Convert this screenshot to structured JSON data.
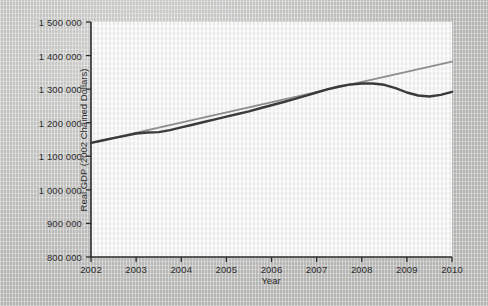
{
  "chart_data": {
    "type": "line",
    "title": "",
    "xlabel": "Year",
    "ylabel": "Real GDP (2002 Chained Dollars)",
    "xlim": [
      2002,
      2010
    ],
    "ylim": [
      800000,
      1500000
    ],
    "grid": false,
    "legend": "none",
    "xticklabels": [
      "2002",
      "2003",
      "2004",
      "2005",
      "2006",
      "2007",
      "2008",
      "2009",
      "2010"
    ],
    "xtickvalues": [
      2002,
      2003,
      2004,
      2005,
      2006,
      2007,
      2008,
      2009,
      2010
    ],
    "yticklabels": [
      "800 000",
      "900 000",
      "1 000 000",
      "1 100 000",
      "1 200 000",
      "1 300 000",
      "1 400 000",
      "1 500 000"
    ],
    "ytickvalues": [
      800000,
      900000,
      1000000,
      1100000,
      1200000,
      1300000,
      1400000,
      1500000
    ],
    "series": [
      {
        "name": "Trend",
        "color": "#8d8d8d",
        "width": 2.0,
        "x": [
          2002.0,
          2010.0
        ],
        "values": [
          1140000,
          1382000
        ]
      },
      {
        "name": "Real GDP",
        "color": "#3a3a3a",
        "width": 2.4,
        "x": [
          2002.0,
          2002.25,
          2002.5,
          2002.75,
          2003.0,
          2003.25,
          2003.5,
          2003.75,
          2004.0,
          2004.25,
          2004.5,
          2004.75,
          2005.0,
          2005.25,
          2005.5,
          2005.75,
          2006.0,
          2006.25,
          2006.5,
          2006.75,
          2007.0,
          2007.25,
          2007.5,
          2007.75,
          2008.0,
          2008.25,
          2008.5,
          2008.75,
          2009.0,
          2009.25,
          2009.5,
          2009.75,
          2010.0
        ],
        "values": [
          1140000,
          1147000,
          1154000,
          1161000,
          1168000,
          1171000,
          1172000,
          1178000,
          1186000,
          1194000,
          1202000,
          1210000,
          1218000,
          1226000,
          1234000,
          1243000,
          1252000,
          1261000,
          1270000,
          1280000,
          1290000,
          1300000,
          1308000,
          1314000,
          1317000,
          1317000,
          1313000,
          1303000,
          1290000,
          1281000,
          1278000,
          1283000,
          1292000
        ]
      }
    ]
  }
}
